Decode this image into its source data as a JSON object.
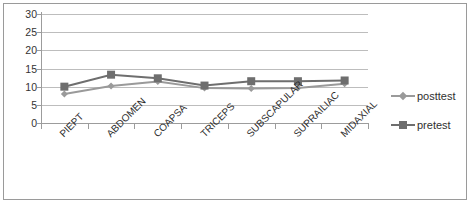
{
  "chart_data": {
    "type": "line",
    "title": "",
    "xlabel": "",
    "ylabel": "",
    "ylim": [
      0,
      30
    ],
    "yticks": [
      0,
      5,
      10,
      15,
      20,
      25,
      30
    ],
    "grid": true,
    "legend_position": "right",
    "categories": [
      "PIEPT",
      "ABDOMEN",
      "COAPSA",
      "TRICEPS",
      "SUBSCAPULAR",
      "SUPRAILIAC",
      "MIDAXIAL"
    ],
    "series": [
      {
        "name": "posttest",
        "marker": "diamond",
        "color": "#9a9a9a",
        "values": [
          8.0,
          10.2,
          11.4,
          9.6,
          9.5,
          9.6,
          10.8
        ]
      },
      {
        "name": "pretest",
        "marker": "square",
        "color": "#6e6e6e",
        "values": [
          10.0,
          13.3,
          12.3,
          10.3,
          11.5,
          11.5,
          11.7
        ]
      }
    ]
  },
  "axis": {
    "y_tick_labels": [
      "30",
      "25",
      "20",
      "15",
      "10",
      "5",
      "0"
    ]
  },
  "legend": {
    "items": [
      {
        "label": "posttest"
      },
      {
        "label": "pretest"
      }
    ]
  },
  "colors": {
    "posttest": "#9a9a9a",
    "pretest": "#6e6e6e",
    "grid": "#bdbdbd",
    "axis": "#9c9c9c",
    "border": "#9a9a9a",
    "text": "#2f2f2f",
    "background": "#ffffff"
  }
}
